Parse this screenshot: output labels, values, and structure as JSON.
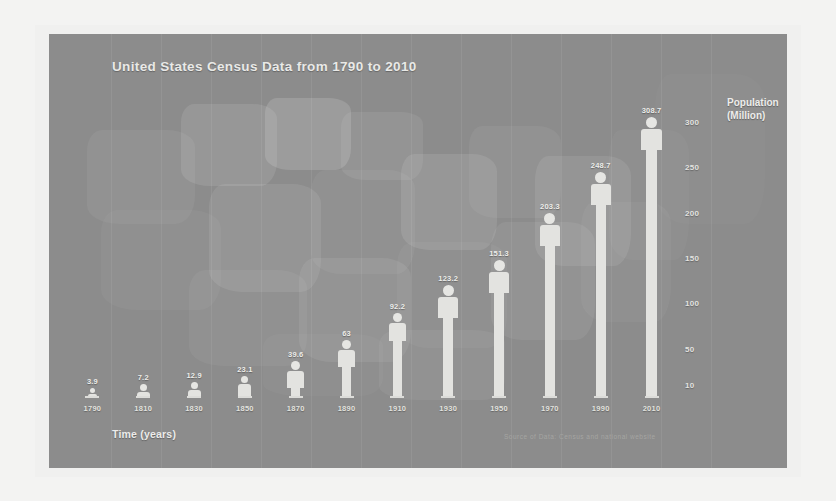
{
  "chart_data": {
    "type": "bar",
    "title": "United States Census Data from 1790 to 2010",
    "xlabel": "Time (years)",
    "ylabel": "Population (Million)",
    "categories": [
      "1790",
      "1810",
      "1830",
      "1850",
      "1870",
      "1890",
      "1910",
      "1930",
      "1950",
      "1970",
      "1990",
      "2010"
    ],
    "values": [
      3.9,
      7.2,
      12.9,
      23.1,
      39.6,
      63,
      92.2,
      123.2,
      151.3,
      203.3,
      248.7,
      308.7
    ],
    "value_labels": [
      "3.9",
      "7.2",
      "12.9",
      "23.1",
      "39.6",
      "63",
      "92.2",
      "123.2",
      "151.3",
      "203.3",
      "248.7",
      "308.7"
    ],
    "ytick_labels": [
      "300",
      "250",
      "200",
      "150",
      "100",
      "50",
      "10"
    ],
    "ytick_values": [
      300,
      250,
      200,
      150,
      100,
      50,
      10
    ],
    "ylim": [
      0,
      320
    ],
    "grid": true,
    "legend": "none",
    "series_name": "Population"
  },
  "annotations": {
    "source": "Source of Data: Census and national website"
  },
  "style": {
    "panel_bg": "#8c8c8c",
    "bar_color": "#e3e3e0",
    "text_color": "#ededea",
    "page_bg": "#f3f3f2"
  }
}
